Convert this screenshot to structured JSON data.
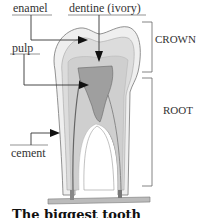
{
  "diagram": {
    "labels": {
      "enamel": "enamel",
      "dentine": "dentine (ivory)",
      "pulp": "pulp",
      "cement": "cement",
      "crown": "CROWN",
      "root": "ROOT"
    },
    "caption": "The biggest tooth",
    "colors": {
      "enamel": "#e8e8e8",
      "dentine": "#d4d4d4",
      "pulp": "#9a9a9a",
      "lines": "#555555"
    }
  }
}
